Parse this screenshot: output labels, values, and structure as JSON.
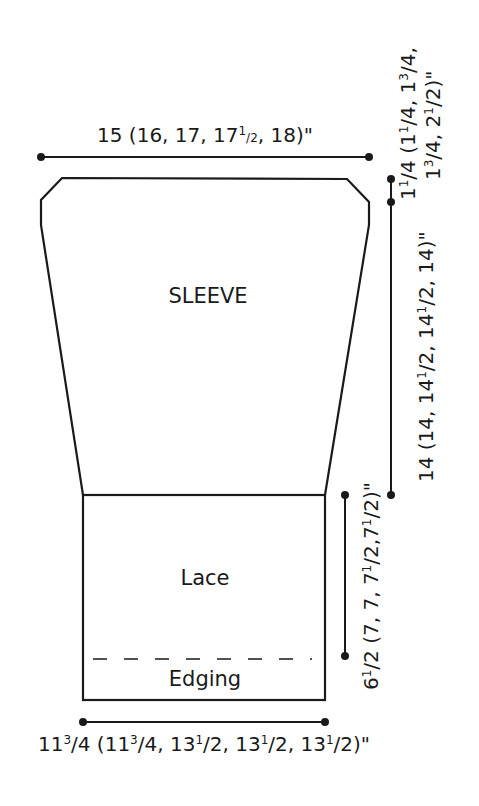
{
  "diagram": {
    "type": "knitting-schematic",
    "colors": {
      "ink": "#1a1a1a",
      "background": "#ffffff"
    },
    "parts": {
      "sleeve_label": "SLEEVE",
      "lace_label": "Lace",
      "edging_label": "Edging"
    },
    "measurements": {
      "top_width": {
        "a": "15 (16, 17, 17",
        "sup": "1",
        "b": "/",
        "sub": "2",
        "c": ", 18)\""
      },
      "cap_depth": {
        "line1_a": "1",
        "line1_s1": "1",
        "line1_b": "/4 (1",
        "line1_s2": "1",
        "line1_c": "/4, 1",
        "line1_s3": "3",
        "line1_d": "/4,",
        "line2_a": "1",
        "line2_s1": "3",
        "line2_b": "/4, 2",
        "line2_s2": "1",
        "line2_c": "/2)\""
      },
      "sleeve_length": {
        "a": "14 (14, 14",
        "s1": "1",
        "b": "/2, 14",
        "s2": "1",
        "c": "/2, 14)\""
      },
      "lace_length": {
        "a": "6",
        "s1": "1",
        "b": "/2 (7, 7, 7",
        "s2": "1",
        "c": "/2,7",
        "s3": "1",
        "d": "/2)\""
      },
      "bottom_width": {
        "a": "11",
        "s1": "3",
        "b": "/4 (11",
        "s2": "3",
        "c": "/4, 13",
        "s3": "1",
        "d": "/2, 13",
        "s4": "1",
        "e": "/2, 13",
        "s5": "1",
        "f": "/2)\""
      }
    }
  }
}
